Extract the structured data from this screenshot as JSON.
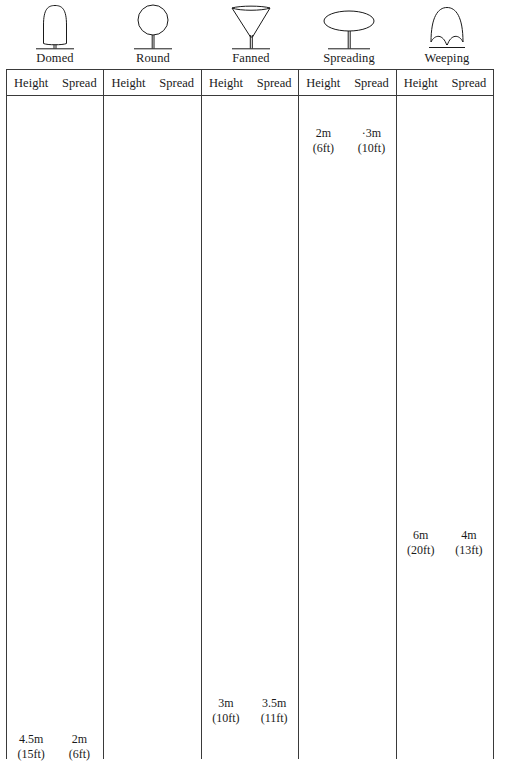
{
  "figure": {
    "ink_color": "#1a1a1a",
    "rule_color": "#3a3a3a",
    "background_color": "#ffffff"
  },
  "columns": [
    {
      "shape_name": "Domed",
      "icon": "domed-tree-icon",
      "headers": {
        "height": "Height",
        "spread": "Spread"
      },
      "height": {
        "metric": "4.5m",
        "imperial": "(15ft)"
      },
      "spread": {
        "metric": "2m",
        "imperial": "(6ft)"
      },
      "value_top_offset_px": 636
    },
    {
      "shape_name": "Round",
      "icon": "round-tree-icon",
      "headers": {
        "height": "Height",
        "spread": "Spread"
      },
      "height": {
        "metric": "",
        "imperial": ""
      },
      "spread": {
        "metric": "",
        "imperial": ""
      },
      "value_top_offset_px": 0
    },
    {
      "shape_name": "Fanned",
      "icon": "fanned-tree-icon",
      "headers": {
        "height": "Height",
        "spread": "Spread"
      },
      "height": {
        "metric": "3m",
        "imperial": "(10ft)"
      },
      "spread": {
        "metric": "3.5m",
        "imperial": "(11ft)"
      },
      "value_top_offset_px": 600
    },
    {
      "shape_name": "Spreading",
      "icon": "spreading-tree-icon",
      "headers": {
        "height": "Height",
        "spread": "Spread"
      },
      "height": {
        "metric": "2m",
        "imperial": "(6ft)"
      },
      "spread": {
        "metric": "3m",
        "imperial": "(10ft)"
      },
      "spread_leading_mark": "·",
      "value_top_offset_px": 30
    },
    {
      "shape_name": "Weeping",
      "icon": "weeping-tree-icon",
      "headers": {
        "height": "Height",
        "spread": "Spread"
      },
      "height": {
        "metric": "6m",
        "imperial": "(20ft)"
      },
      "spread": {
        "metric": "4m",
        "imperial": "(13ft)"
      },
      "value_top_offset_px": 432
    }
  ]
}
